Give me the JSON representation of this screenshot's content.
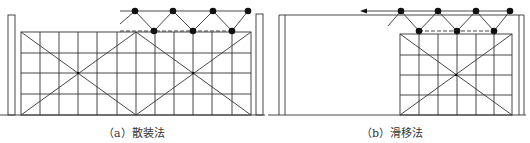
{
  "figures": [
    {
      "id": "a",
      "caption": "（a）散装法",
      "method": "散装法"
    },
    {
      "id": "b",
      "caption": "（b）滑移法",
      "method": "滑移法"
    }
  ],
  "colors": {
    "line": "#333333",
    "node": "#111111",
    "background": "#ffffff"
  }
}
